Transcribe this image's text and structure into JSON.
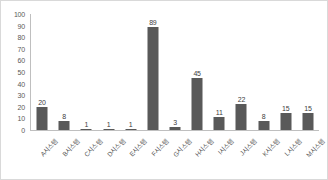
{
  "chart_data": {
    "type": "bar",
    "title": "",
    "xlabel": "",
    "ylabel": "",
    "ylim": [
      0,
      100
    ],
    "yticks": [
      100,
      90,
      80,
      70,
      60,
      50,
      40,
      30,
      20,
      10,
      0
    ],
    "grid": false,
    "legend": false,
    "bar_color": "#595959",
    "categories": [
      "A시스템",
      "B시스템",
      "C시스템",
      "D시스템",
      "E시스템",
      "F시스템",
      "G시스템",
      "H시스템",
      "I시스템",
      "J시스템",
      "K시스템",
      "L시스템",
      "M시스템"
    ],
    "values": [
      20,
      8,
      1,
      1,
      1,
      89,
      3,
      45,
      11,
      22,
      8,
      15,
      15
    ],
    "data_labels": [
      "20",
      "8",
      "1",
      "1",
      "1",
      "89",
      "3",
      "45",
      "11",
      "22",
      "8",
      "15",
      "15"
    ]
  }
}
